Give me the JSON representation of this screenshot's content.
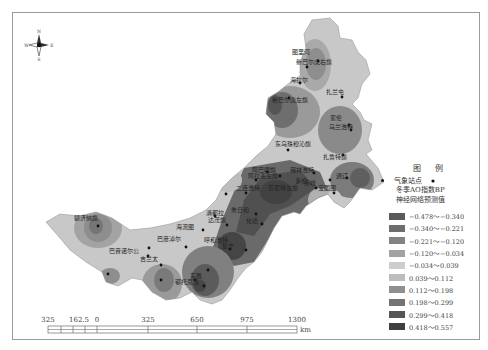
{
  "compass": {
    "north": "N",
    "south": "S",
    "east": "E",
    "west": "W"
  },
  "legend": {
    "title": "图 例",
    "station_label": "气象站点",
    "subtitle_line1": "冬季AO指数BP",
    "subtitle_line2": "神经网络预测值",
    "classes": [
      {
        "range": "−0.478～−0.340",
        "color": "#5a5a5a"
      },
      {
        "range": "−0.340～−0.221",
        "color": "#6e6e6e"
      },
      {
        "range": "−0.221～−0.120",
        "color": "#838383"
      },
      {
        "range": "−0.120～−0.034",
        "color": "#a2a2a2"
      },
      {
        "range": "−0.034～0.039",
        "color": "#cdcdcd"
      },
      {
        "range": "0.039～0.112",
        "color": "#bdbdbd"
      },
      {
        "range": "0.112～0.198",
        "color": "#8f8f8f"
      },
      {
        "range": "0.198～0.299",
        "color": "#747474"
      },
      {
        "range": "0.299～0.418",
        "color": "#555555"
      },
      {
        "range": "0.418～0.557",
        "color": "#3f3f3f"
      }
    ]
  },
  "scalebar": {
    "labels": [
      "325",
      "162.5",
      "0",
      "325",
      "650",
      "975",
      "1300"
    ],
    "unit": "km"
  },
  "stations": [
    {
      "name": "图里河",
      "x": 318,
      "y": 61
    },
    {
      "name": "新巴尔虎右旗",
      "x": 307,
      "y": 67
    },
    {
      "name": "海拉尔",
      "x": 300,
      "y": 83
    },
    {
      "name": "新巴尔虎左旗",
      "x": 289,
      "y": 98
    },
    {
      "name": "扎兰屯",
      "x": 342,
      "y": 97
    },
    {
      "name": "索伦",
      "x": 349,
      "y": 125
    },
    {
      "name": "乌兰浩特",
      "x": 351,
      "y": 130
    },
    {
      "name": "东乌珠穆沁旗",
      "x": 288,
      "y": 150
    },
    {
      "name": "扎鲁特旗",
      "x": 343,
      "y": 155
    },
    {
      "name": "西乌珠穆沁旗",
      "x": 267,
      "y": 172
    },
    {
      "name": "巴林左旗",
      "x": 314,
      "y": 173
    },
    {
      "name": "阿巴嘎旗",
      "x": 256,
      "y": 180
    },
    {
      "name": "锡林浩特",
      "x": 280,
      "y": 176
    },
    {
      "name": "通辽",
      "x": 330,
      "y": 180
    },
    {
      "name": "开鲁",
      "x": 347,
      "y": 178
    },
    {
      "name": "赤峰",
      "x": 316,
      "y": 188
    },
    {
      "name": "宝国图",
      "x": 334,
      "y": 193
    },
    {
      "name": "苏尼特左旗",
      "x": 246,
      "y": 193
    },
    {
      "name": "二连浩特",
      "x": 226,
      "y": 194
    },
    {
      "name": "满都拉",
      "x": 215,
      "y": 216
    },
    {
      "name": "朱日和",
      "x": 256,
      "y": 214
    },
    {
      "name": "海流图",
      "x": 203,
      "y": 230
    },
    {
      "name": "达茂旗",
      "x": 227,
      "y": 225
    },
    {
      "name": "化德",
      "x": 262,
      "y": 224
    },
    {
      "name": "呼和浩特",
      "x": 230,
      "y": 249
    },
    {
      "name": "集宁",
      "x": 246,
      "y": 250
    },
    {
      "name": "巴彦淖尔",
      "x": 186,
      "y": 247
    },
    {
      "name": "额济纳旗",
      "x": 98,
      "y": 226
    },
    {
      "name": "巴音毛道",
      "x": 149,
      "y": 248
    },
    {
      "name": "巴音诺尔公",
      "x": 148,
      "y": 256
    },
    {
      "name": "吉兰太",
      "x": 161,
      "y": 265
    },
    {
      "name": "拐子湖",
      "x": 108,
      "y": 274
    },
    {
      "name": "乌海",
      "x": 161,
      "y": 280
    },
    {
      "name": "东胜",
      "x": 208,
      "y": 270
    },
    {
      "name": "鄂托克旗",
      "x": 195,
      "y": 280
    },
    {
      "name": "伊金霍洛旗",
      "x": 204,
      "y": 286
    }
  ],
  "labels": [
    {
      "text": "图里河",
      "x": 302,
      "y": 52
    },
    {
      "text": "新巴尔虎右旗",
      "x": 306,
      "y": 62
    },
    {
      "text": "海拉尔",
      "x": 300,
      "y": 80
    },
    {
      "text": "新巴尔虎左旗",
      "x": 282,
      "y": 100
    },
    {
      "text": "扎兰屯",
      "x": 336,
      "y": 92
    },
    {
      "text": "索伦",
      "x": 340,
      "y": 118
    },
    {
      "text": "乌兰浩特",
      "x": 339,
      "y": 127
    },
    {
      "text": "东乌珠穆沁旗",
      "x": 285,
      "y": 144
    },
    {
      "text": "扎鲁特旗",
      "x": 333,
      "y": 157
    },
    {
      "text": "阿巴嘎旗",
      "x": 262,
      "y": 170
    },
    {
      "text": "锡林浩特",
      "x": 300,
      "y": 170
    },
    {
      "text": "阿拉善左旗",
      "x": 258,
      "y": 176
    },
    {
      "text": "通辽",
      "x": 346,
      "y": 176
    },
    {
      "text": "赤峰",
      "x": 314,
      "y": 183
    },
    {
      "text": "多伦",
      "x": 305,
      "y": 181
    },
    {
      "text": "宝国图",
      "x": 328,
      "y": 188
    },
    {
      "text": "二连浩特",
      "x": 246,
      "y": 188
    },
    {
      "text": "苏尼特左旗",
      "x": 278,
      "y": 188
    },
    {
      "text": "满都拉",
      "x": 216,
      "y": 213
    },
    {
      "text": "朱日和",
      "x": 241,
      "y": 210
    },
    {
      "text": "海流图",
      "x": 186,
      "y": 227
    },
    {
      "text": "达茂旗",
      "x": 218,
      "y": 220
    },
    {
      "text": "化德",
      "x": 256,
      "y": 221
    },
    {
      "text": "呼和浩特",
      "x": 214,
      "y": 240
    },
    {
      "text": "集宁",
      "x": 232,
      "y": 246
    },
    {
      "text": "巴彦淖尔",
      "x": 167,
      "y": 239
    },
    {
      "text": "额济纳旗",
      "x": 84,
      "y": 218
    },
    {
      "text": "巴音诺尔公",
      "x": 119,
      "y": 251
    },
    {
      "text": "吉兰太",
      "x": 150,
      "y": 259
    },
    {
      "text": "东胜",
      "x": 200,
      "y": 276
    },
    {
      "text": "鄂托克旗",
      "x": 185,
      "y": 282
    }
  ]
}
